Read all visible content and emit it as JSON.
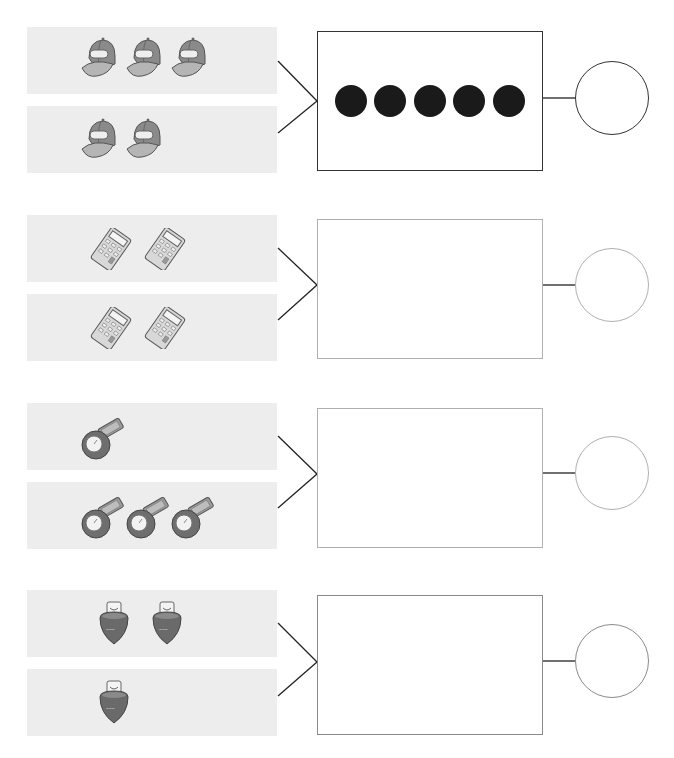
{
  "worksheet": {
    "groups": [
      {
        "id": "group-1",
        "object": "cap",
        "top_panel": {
          "object": "cap",
          "count": 3
        },
        "bottom_panel": {
          "object": "cap",
          "count": 2
        },
        "total_box": {
          "dots": 5,
          "filled": true
        },
        "answer_circle": {
          "value": ""
        },
        "border_color": "#333333"
      },
      {
        "id": "group-2",
        "object": "calculator",
        "top_panel": {
          "object": "calculator",
          "count": 2
        },
        "bottom_panel": {
          "object": "calculator",
          "count": 2
        },
        "total_box": {
          "dots": 0,
          "filled": false
        },
        "answer_circle": {
          "value": ""
        },
        "border_color": "#b0b0b0"
      },
      {
        "id": "group-3",
        "object": "stopwatch",
        "top_panel": {
          "object": "stopwatch",
          "count": 1
        },
        "bottom_panel": {
          "object": "stopwatch",
          "count": 3
        },
        "total_box": {
          "dots": 0,
          "filled": false
        },
        "answer_circle": {
          "value": ""
        },
        "border_color": "#b0b0b0"
      },
      {
        "id": "group-4",
        "object": "acorn-bottle",
        "top_panel": {
          "object": "acorn-bottle",
          "count": 2
        },
        "bottom_panel": {
          "object": "acorn-bottle",
          "count": 1
        },
        "total_box": {
          "dots": 0,
          "filled": false
        },
        "answer_circle": {
          "value": ""
        },
        "border_color": "#8a8a8a"
      }
    ],
    "colors": {
      "panel_bg": "#ededed",
      "dot": "#1a1a1a",
      "connector": "#222222"
    }
  }
}
